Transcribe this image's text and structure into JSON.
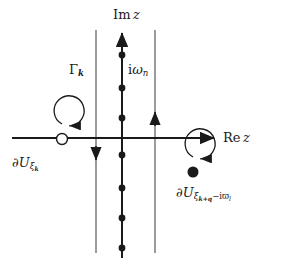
{
  "figure": {
    "kind": "complex-plane-contour-diagram",
    "background_color": "#ffffff",
    "ink_color": "#1a1a1a",
    "width": 282,
    "height": 265,
    "axes": {
      "real_axis": {
        "label_prefix": "Re",
        "label_variable": "z",
        "label_text": "Re z",
        "arrow_direction": "right",
        "x_start": 12,
        "x_end": 218,
        "y": 138
      },
      "imaginary_axis": {
        "label_prefix": "Im",
        "label_variable": "z",
        "label_text": "Im z",
        "arrow_direction": "up",
        "x": 122,
        "y_start": 258,
        "y_end": 28
      },
      "origin": {
        "x": 122,
        "y": 138
      }
    },
    "matsubara_axis": {
      "name": "i-omega-n-axis",
      "label_text": "iω",
      "label_prefix": "i",
      "label_variable": "ω",
      "label_subscript": "n",
      "label_x": 128,
      "label_y": 64,
      "pole_marker": "filled-dot",
      "pole_radius": 3.4,
      "poles_y": [
        55,
        88,
        118,
        155,
        188,
        218,
        248
      ],
      "poles_x": 122
    },
    "vertical_lines": [
      {
        "name": "gamma-k-contour-line",
        "label_text": "Γ",
        "label_subscript": "k",
        "label_x": 69,
        "label_y": 64,
        "x": 96,
        "y_top": 30,
        "y_bottom": 253,
        "arrow_direction": "down",
        "arrow_y": 158
      },
      {
        "name": "right-contour-line",
        "label_text": "",
        "x": 155,
        "y_top": 30,
        "y_bottom": 253,
        "arrow_direction": "up",
        "arrow_y": 112
      }
    ],
    "contours": [
      {
        "name": "left-contour",
        "label_prefix": "∂U",
        "label_subscript": "ξ",
        "label_sub_subscript": "k",
        "label_text": "∂U",
        "label_x": 12,
        "label_y": 158,
        "center_x": 62,
        "center_y": 139,
        "radius": 15,
        "orientation": "counterclockwise",
        "pole_marker": "open-circle",
        "pole_radius": 5.5
      },
      {
        "name": "right-contour",
        "label_prefix": "∂U",
        "label_subscript": "ξ",
        "label_sub_subscript": "k+q",
        "label_sub_tail": "−iϖ",
        "label_sub_tail_subscript": "l",
        "label_text": "∂U",
        "label_x": 176,
        "label_y": 188,
        "center_x": 193,
        "center_y": 172,
        "radius": 15,
        "orientation": "counterclockwise",
        "pole_marker": "filled-dot",
        "pole_radius": 5.5
      }
    ]
  }
}
